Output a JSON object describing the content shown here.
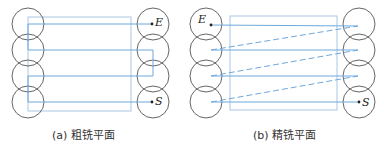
{
  "figures": [
    {
      "id": "a",
      "caption": "(a) 粗铣平面",
      "start_label": "S",
      "end_label": "E",
      "path_style": "solid zigzag return",
      "circles": {
        "left_cx": 28,
        "right_cx": 153,
        "cy": [
          24,
          50,
          76,
          102
        ],
        "r": 16
      },
      "rect": {
        "x": 28,
        "y": 17,
        "w": 103,
        "h": 94
      },
      "path_points": [
        [
          152,
          102
        ],
        [
          28,
          102
        ],
        [
          28,
          76
        ],
        [
          153,
          76
        ],
        [
          153,
          50
        ],
        [
          28,
          50
        ],
        [
          28,
          24
        ],
        [
          152,
          24
        ]
      ]
    },
    {
      "id": "b",
      "caption": "(b) 精铣平面",
      "start_label": "S",
      "end_label": "E",
      "path_style": "solid cut lines, dashed rapid returns",
      "circles": {
        "left_cx": 206,
        "right_cx": 359,
        "cy": [
          24,
          50,
          76,
          102
        ],
        "r": 16
      },
      "rect": {
        "x": 230,
        "y": 16,
        "w": 107,
        "h": 94
      },
      "solid_lines": [
        [
          [
            359,
            102
          ],
          [
            211,
            102
          ]
        ],
        [
          [
            358,
            76
          ],
          [
            211,
            76
          ]
        ],
        [
          [
            358,
            50
          ],
          [
            211,
            50
          ]
        ],
        [
          [
            358,
            26
          ],
          [
            211,
            25
          ]
        ]
      ],
      "dashed_lines": [
        [
          [
            211,
            102
          ],
          [
            358,
            76
          ]
        ],
        [
          [
            211,
            76
          ],
          [
            358,
            50
          ]
        ],
        [
          [
            211,
            50
          ],
          [
            358,
            26
          ]
        ]
      ]
    }
  ],
  "colors": {
    "circle": "#555555",
    "path": "#6fa8dc",
    "rect": "#a9c6e3",
    "text": "#222222"
  }
}
